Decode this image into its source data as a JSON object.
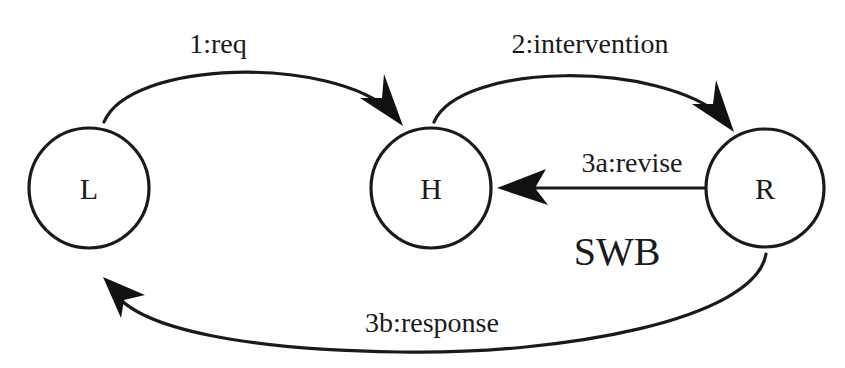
{
  "diagram": {
    "nodes": [
      {
        "id": "L",
        "label": "L"
      },
      {
        "id": "H",
        "label": "H"
      },
      {
        "id": "R",
        "label": "R"
      }
    ],
    "edges": [
      {
        "from": "L",
        "to": "H",
        "label": "1:req"
      },
      {
        "from": "H",
        "to": "R",
        "label": "2:intervention"
      },
      {
        "from": "R",
        "to": "H",
        "label": "3a:revise"
      },
      {
        "from": "R",
        "to": "L",
        "label": "3b:response"
      }
    ],
    "annotation": "SWB",
    "colors": {
      "stroke": "#1a1a1a",
      "background": "#ffffff"
    }
  }
}
